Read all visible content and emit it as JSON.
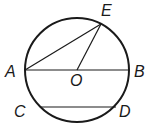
{
  "diagram": {
    "type": "circle-geometry",
    "points": {
      "A": {
        "label": "A"
      },
      "B": {
        "label": "B"
      },
      "C": {
        "label": "C"
      },
      "D": {
        "label": "D"
      },
      "E": {
        "label": "E"
      },
      "O": {
        "label": "O"
      }
    },
    "segments": [
      {
        "from": "A",
        "to": "B",
        "role": "diameter"
      },
      {
        "from": "A",
        "to": "E",
        "role": "chord"
      },
      {
        "from": "O",
        "to": "E",
        "role": "radius"
      },
      {
        "from": "C",
        "to": "D",
        "role": "chord"
      }
    ],
    "stroke_color": "#1a1a1a"
  }
}
